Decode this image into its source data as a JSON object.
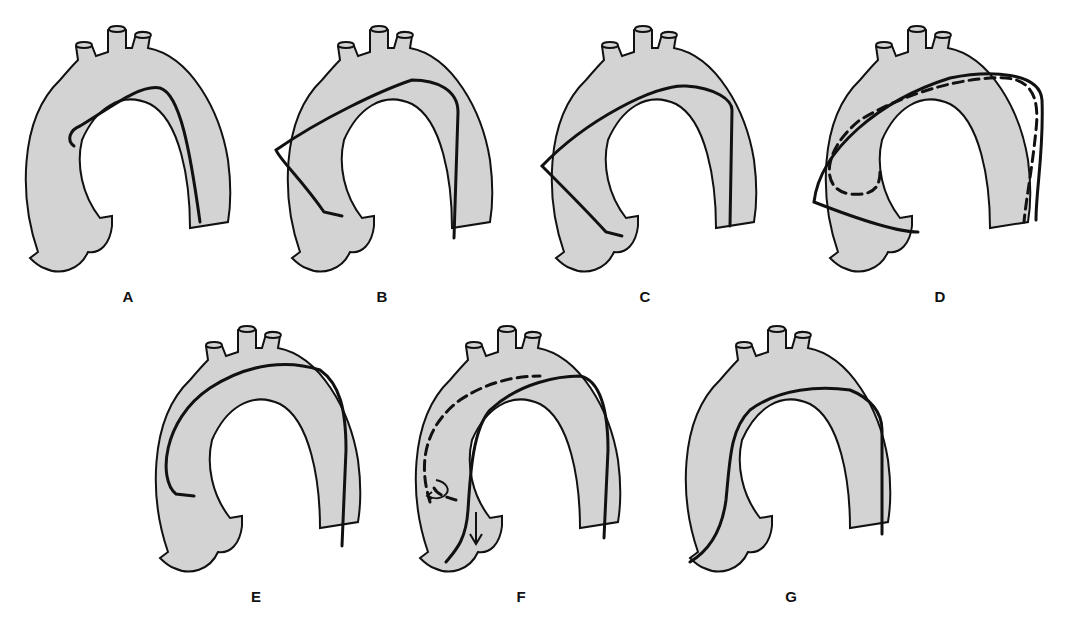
{
  "figure": {
    "type": "aortic-arch-catheter-panels",
    "colors": {
      "vessel_fill": "#d3d3d3",
      "outline": "#111111",
      "background": "#ffffff"
    },
    "panels": [
      {
        "id": "A",
        "label": "A",
        "label_pos": [
          128,
          298
        ],
        "origin": [
          0,
          0
        ],
        "catheter": {
          "style": "solid",
          "description": "Catheter curls back at the ascending aorta just beyond the arch apex"
        }
      },
      {
        "id": "B",
        "label": "B",
        "label_pos": [
          382,
          298
        ],
        "origin": [
          262,
          0
        ],
        "catheter": {
          "style": "solid",
          "description": "Catheter loops across the arch, angled down along the outer ascending wall"
        }
      },
      {
        "id": "C",
        "label": "C",
        "label_pos": [
          645,
          298
        ],
        "origin": [
          526,
          0
        ],
        "catheter": {
          "style": "solid",
          "description": "Catheter forms a sharp V against the outer ascending wall toward the root"
        }
      },
      {
        "id": "D",
        "label": "D",
        "label_pos": [
          940,
          298
        ],
        "origin": [
          800,
          0
        ],
        "catheter": {
          "style": "solid+dashed",
          "description": "Solid and dashed catheter courses forming a wide loop in the ascending aorta"
        }
      },
      {
        "id": "E",
        "label": "E",
        "label_pos": [
          256,
          598
        ],
        "origin": [
          130,
          300
        ],
        "catheter": {
          "style": "solid",
          "description": "Catheter hugs the outer curvature and hooks back in the ascending aorta"
        }
      },
      {
        "id": "F",
        "label": "F",
        "label_pos": [
          521,
          598
        ],
        "origin": [
          390,
          300
        ],
        "catheter": {
          "style": "solid+dashed",
          "description": "Solid catheter along inner curve to the root; dashed path along outer curve with rotation arrow and downward arrow"
        }
      },
      {
        "id": "G",
        "label": "G",
        "label_pos": [
          791,
          598
        ],
        "origin": [
          660,
          300
        ],
        "catheter": {
          "style": "solid",
          "description": "Catheter follows inner curvature down to the aortic root"
        }
      }
    ]
  }
}
